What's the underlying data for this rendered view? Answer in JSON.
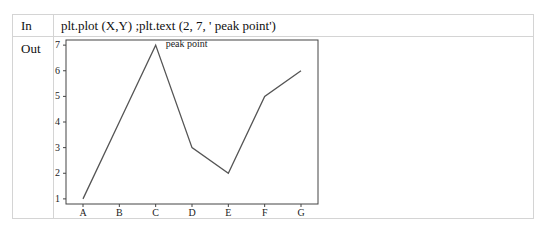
{
  "cells": {
    "in_label": "In",
    "out_label": "Out",
    "code": "plt.plot (X,Y) ;plt.text (2, 7, ' peak point')"
  },
  "chart_data": {
    "type": "line",
    "categories": [
      "A",
      "B",
      "C",
      "D",
      "E",
      "F",
      "G"
    ],
    "values": [
      1,
      4,
      7,
      3,
      2,
      5,
      6
    ],
    "annotation": {
      "text": "peak point",
      "x": 2,
      "y": 7
    },
    "yticks": [
      1,
      2,
      3,
      4,
      5,
      6,
      7
    ],
    "ylim": [
      0.8,
      7.2
    ],
    "title": "",
    "xlabel": "",
    "ylabel": "",
    "line_color": "#555555"
  }
}
